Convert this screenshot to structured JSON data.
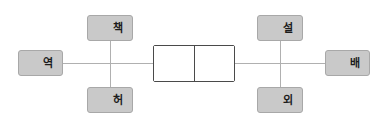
{
  "diagram": {
    "type": "radical-decomposition-diagram",
    "background_color": "#ffffff",
    "line_color": "#b0b0b0",
    "box_fill_color": "#c9c9c9",
    "box_border_color": "#a8a8a8",
    "center_border_color": "#4a4a4a",
    "center_fill_color": "#ffffff",
    "center": {
      "label": "",
      "left_cell_label": "",
      "right_cell_label": ""
    },
    "nodes": {
      "left_outer": {
        "label": "역",
        "position": "left"
      },
      "left_top": {
        "label": "책",
        "position": "top-left"
      },
      "left_bottom": {
        "label": "허",
        "position": "bottom-left"
      },
      "right_outer": {
        "label": "배",
        "position": "right"
      },
      "right_top": {
        "label": "설",
        "position": "top-right"
      },
      "right_bottom": {
        "label": "외",
        "position": "bottom-right"
      }
    }
  }
}
